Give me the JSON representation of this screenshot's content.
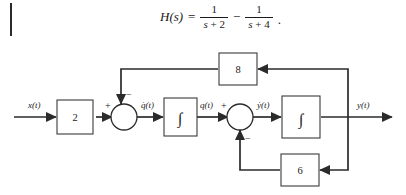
{
  "equation": {
    "lhs": "H(s)",
    "equals": "=",
    "term1": {
      "numerator": "1",
      "den_var": "s",
      "den_op": "+",
      "den_num": "2"
    },
    "operator": "−",
    "term2": {
      "numerator": "1",
      "den_var": "s",
      "den_op": "+",
      "den_num": "4"
    },
    "terminator": "."
  },
  "diagram": {
    "input_label": "x(t)",
    "output_label": "y(t)",
    "gain_input": "2",
    "gain_feedback_top": "8",
    "gain_feedback_bottom": "6",
    "integrator_symbol": "∫",
    "signal_qdot": "q̇(t)",
    "signal_q": "q(t)",
    "signal_ydot": "ẏ(t)",
    "summer1": {
      "sign_left": "+",
      "sign_top": "−"
    },
    "summer2": {
      "sign_left": "+",
      "sign_bottom": "−"
    }
  },
  "colors": {
    "ink": "#1a1a1a",
    "wire": "#2b2b2b",
    "block_stroke": "#3a3a3a",
    "background": "#ffffff"
  }
}
